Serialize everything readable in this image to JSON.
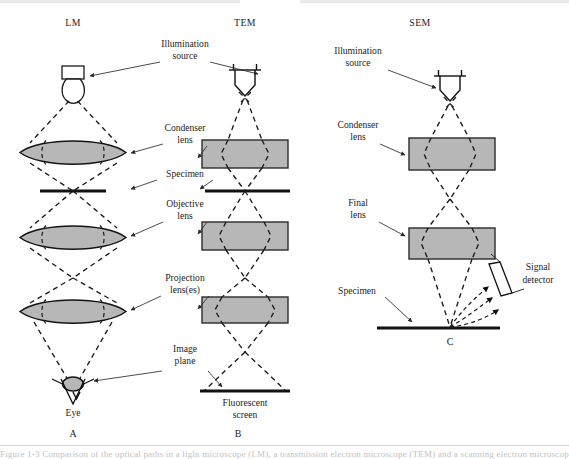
{
  "figure": {
    "background_color": "#ffffff",
    "ink_color": "#1a1a1a",
    "lens_fill_color": "#b7b7b7",
    "caption_sliver": "Figure 1-3   Comparison of the optical paths in a light microscope (LM), a transmission electron microscope (TEM) and a scanning electron microscope (SEM)."
  },
  "columns": {
    "lm": {
      "header": "LM",
      "panel_letter": "A"
    },
    "tem": {
      "header": "TEM",
      "panel_letter": "B"
    },
    "sem": {
      "header": "SEM",
      "panel_letter": "C"
    }
  },
  "center_labels": [
    {
      "id": "illumination-source",
      "line1": "Illumination",
      "line2": "source"
    },
    {
      "id": "condenser-lens",
      "line1": "Condenser",
      "line2": "lens"
    },
    {
      "id": "specimen",
      "line1": "Specimen",
      "line2": ""
    },
    {
      "id": "objective-lens",
      "line1": "Objective",
      "line2": "lens"
    },
    {
      "id": "projection-lens",
      "line1": "Projection",
      "line2": "lens(es)"
    },
    {
      "id": "image-plane",
      "line1": "Image",
      "line2": "plane"
    }
  ],
  "sem_labels": [
    {
      "id": "sem-illumination-source",
      "line1": "Illumination",
      "line2": "source"
    },
    {
      "id": "sem-condenser-lens",
      "line1": "Condenser",
      "line2": "lens"
    },
    {
      "id": "sem-final-lens",
      "line1": "Final",
      "line2": "lens"
    },
    {
      "id": "sem-specimen",
      "line1": "Specimen",
      "line2": ""
    },
    {
      "id": "sem-signal-detector",
      "line1": "Signal",
      "line2": "detector"
    }
  ],
  "lm_labels": {
    "eye": "Eye"
  },
  "tem_labels": {
    "screen_line1": "Fluorescent",
    "screen_line2": "screen"
  }
}
